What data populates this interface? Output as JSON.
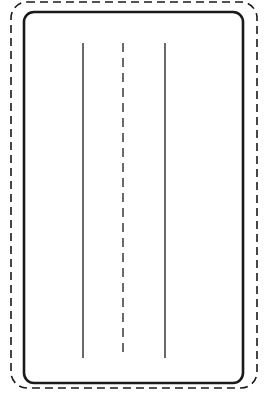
{
  "diagram": {
    "colors": {
      "stroke": "#1a1a1a",
      "background": "#ffffff"
    },
    "outer_boundary": {
      "style": "dashed",
      "x": 11,
      "y": 2,
      "width": 246,
      "height": 386,
      "radius": 16
    },
    "inner_boundary": {
      "style": "solid",
      "x": 24,
      "y": 12,
      "width": 219,
      "height": 371,
      "radius": 10
    },
    "lines": [
      {
        "name": "left-line",
        "style": "solid",
        "x": 83,
        "y1": 43,
        "y2": 358
      },
      {
        "name": "center-line",
        "style": "dashed",
        "x": 123,
        "y1": 43,
        "y2": 358
      },
      {
        "name": "right-line",
        "style": "solid",
        "x": 165,
        "y1": 43,
        "y2": 358
      }
    ]
  }
}
